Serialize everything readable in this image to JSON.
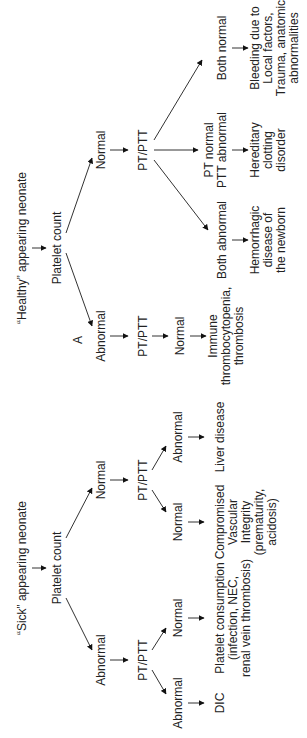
{
  "diagram": {
    "panel_label": "A",
    "sick": {
      "title": "“Sick” appearing neonate",
      "root": "Platelet count",
      "abnormal": "Abnormal",
      "normal": "Normal",
      "abn_ptptt": "PT/PTT",
      "norm_ptptt": "PT/PTT",
      "abn_abn": "Abnormal",
      "abn_norm": "Normal",
      "norm_norm": "Normal",
      "norm_abn": "Abnormal",
      "out_dic": "DIC",
      "out_consumption": [
        "Platelet consumption",
        "(infection, NEC,",
        "renal vein thrombosis)"
      ],
      "out_vascular": [
        "Compromised",
        "Vascular",
        "Integrity",
        "(prematurity,",
        "acidosis)"
      ],
      "out_liver": "Liver disease"
    },
    "healthy": {
      "title": "“Healthy” appearing neonate",
      "root": "Platelet count",
      "abnormal": "Abnormal",
      "normal": "Normal",
      "abn_ptptt": "PT/PTT",
      "abn_result": "Normal",
      "norm_ptptt": "PT/PTT",
      "both_abnormal": "Both abnormal",
      "pt_normal": [
        "PT normal",
        "PTT abnormal"
      ],
      "both_normal": "Both normal",
      "out_immune": [
        "Immune",
        "thrombocytopenia,",
        "thrombosis"
      ],
      "out_hemorrhagic": [
        "Hemorrhagic",
        "disease of",
        "the newborn"
      ],
      "out_hereditary": [
        "Hereditary",
        "clotting",
        "disorder"
      ],
      "out_bleeding": [
        "Bleeding due to",
        "Local factors,",
        "Trauma, anatomic",
        "abnormalities"
      ]
    }
  }
}
